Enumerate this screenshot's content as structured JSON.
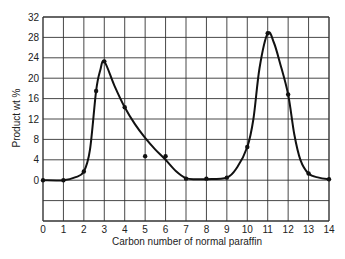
{
  "chart_data": {
    "type": "line",
    "title": "",
    "xlabel": "Carbon number of normal paraffin",
    "ylabel": "Product wt %",
    "xlim": [
      0,
      14
    ],
    "ylim": [
      -8,
      32
    ],
    "x_ticks": [
      0,
      1,
      2,
      3,
      4,
      5,
      6,
      7,
      8,
      9,
      10,
      11,
      12,
      13,
      14
    ],
    "y_ticks": [
      0,
      4,
      8,
      12,
      16,
      20,
      24,
      28,
      32
    ],
    "grid": true,
    "legend": null,
    "series": [
      {
        "name": "Product distribution",
        "points": [
          {
            "x": 0,
            "y": 0
          },
          {
            "x": 1,
            "y": 0
          },
          {
            "x": 2,
            "y": 1.7
          },
          {
            "x": 2.6,
            "y": 17.5
          },
          {
            "x": 3,
            "y": 23.3
          },
          {
            "x": 4,
            "y": 14.3
          },
          {
            "x": 5,
            "y": 4.7
          },
          {
            "x": 6,
            "y": 4.7
          },
          {
            "x": 7,
            "y": 0.3
          },
          {
            "x": 8,
            "y": 0.3
          },
          {
            "x": 9,
            "y": 0.5
          },
          {
            "x": 10,
            "y": 6.5
          },
          {
            "x": 11,
            "y": 28.8
          },
          {
            "x": 12,
            "y": 16.8
          },
          {
            "x": 13,
            "y": 1.3
          },
          {
            "x": 14,
            "y": 0.2
          }
        ],
        "curve": [
          [
            0,
            0
          ],
          [
            1,
            0
          ],
          [
            1.6,
            0.6
          ],
          [
            2,
            1.7
          ],
          [
            2.3,
            6
          ],
          [
            2.6,
            17.5
          ],
          [
            2.8,
            21.5
          ],
          [
            3,
            23.3
          ],
          [
            3.5,
            18.5
          ],
          [
            4,
            14.3
          ],
          [
            4.5,
            11
          ],
          [
            5,
            8.3
          ],
          [
            5.5,
            6
          ],
          [
            6,
            4
          ],
          [
            6.5,
            1.8
          ],
          [
            7,
            0.4
          ],
          [
            7.5,
            0.2
          ],
          [
            8,
            0.2
          ],
          [
            9,
            0.5
          ],
          [
            9.5,
            2.5
          ],
          [
            10,
            6.5
          ],
          [
            10.3,
            12
          ],
          [
            10.6,
            22
          ],
          [
            11,
            28.8
          ],
          [
            11.3,
            27
          ],
          [
            11.6,
            23
          ],
          [
            12,
            16.8
          ],
          [
            12.3,
            9
          ],
          [
            12.6,
            4
          ],
          [
            13,
            1.3
          ],
          [
            13.5,
            0.5
          ],
          [
            14,
            0.2
          ]
        ]
      }
    ]
  }
}
